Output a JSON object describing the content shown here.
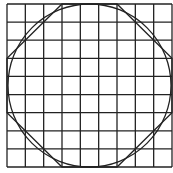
{
  "diagram": {
    "type": "grid-with-inscribed-circle-and-octagon",
    "grid": {
      "columns": 9,
      "rows": 9,
      "x0": 7,
      "y0": 4,
      "x1": 172,
      "y1": 167,
      "stroke": "#222222"
    },
    "circle": {
      "description": "circle inscribed in the 9x9 square",
      "stroke": "#222222"
    },
    "octagon": {
      "description": "octagon formed by cutting 3x3 triangles from each corner of the 9x9 square",
      "vertices_grid": [
        [
          3,
          0
        ],
        [
          6,
          0
        ],
        [
          9,
          3
        ],
        [
          9,
          6
        ],
        [
          6,
          9
        ],
        [
          3,
          9
        ],
        [
          0,
          6
        ],
        [
          0,
          3
        ]
      ],
      "stroke": "#222222"
    }
  }
}
